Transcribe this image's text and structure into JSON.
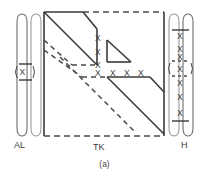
{
  "figure": {
    "caption": "(a)",
    "background_color": "#ffffff",
    "line_color": "#3a3a3a",
    "dash_color": "#4a4a4a"
  },
  "labels": {
    "al": "AL",
    "tk": "TK",
    "h": "H"
  },
  "al_block": {
    "name": "AL",
    "entries": [
      "X"
    ]
  },
  "tk_block": {
    "name": "TK",
    "x_column": [
      "X",
      "X",
      "X"
    ],
    "x_row": [
      "X",
      "X",
      "X",
      "X"
    ]
  },
  "h_block": {
    "name": "H",
    "entries": [
      "X",
      "X",
      "X",
      "X",
      "X",
      "X",
      "X"
    ]
  }
}
